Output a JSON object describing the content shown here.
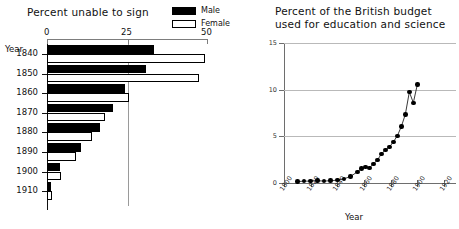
{
  "left": {
    "title": "Percent unable to sign",
    "y_axis_label": "Year",
    "legend": [
      {
        "name": "male-swatch",
        "label": "Male",
        "color": "#000000"
      },
      {
        "name": "female-swatch",
        "label": "Female",
        "color": "#ffffff"
      }
    ],
    "x_ticks": [
      "0",
      "25",
      "50"
    ]
  },
  "right": {
    "title_line1": "Percent of the British budget",
    "title_line2": "used for education and science",
    "x_axis_label": "Year",
    "y_ticks": [
      "0",
      "5",
      "10",
      "15"
    ],
    "x_ticks": [
      "1800",
      "1820",
      "1840",
      "1860",
      "1880",
      "1900",
      "1920"
    ]
  },
  "chart_data": [
    {
      "type": "bar",
      "title": "Percent unable to sign",
      "orientation": "horizontal",
      "xlabel": "",
      "ylabel": "Year",
      "xlim": [
        0,
        50
      ],
      "grid": true,
      "gridlines_x": [
        25
      ],
      "categories": [
        "1840",
        "1850",
        "1860",
        "1870",
        "1880",
        "1890",
        "1900",
        "1910"
      ],
      "series": [
        {
          "name": "Male",
          "color": "#000000",
          "values": [
            33.5,
            31.0,
            24.5,
            20.5,
            16.5,
            10.5,
            4.0,
            1.2
          ]
        },
        {
          "name": "Female",
          "color": "#ffffff",
          "values": [
            49.5,
            47.5,
            25.5,
            18.0,
            14.0,
            9.0,
            4.5,
            1.5
          ]
        }
      ]
    },
    {
      "type": "line",
      "title": "Percent of the British budget used for education and science",
      "xlabel": "Year",
      "ylabel": "",
      "xlim": [
        1800,
        1920
      ],
      "ylim": [
        0,
        15
      ],
      "grid": true,
      "gridlines_y": [
        5,
        10,
        15
      ],
      "markers": "filled-circle",
      "x": [
        1810,
        1815,
        1820,
        1825,
        1830,
        1835,
        1840,
        1845,
        1850,
        1855,
        1858,
        1861,
        1864,
        1867,
        1870,
        1873,
        1876,
        1879,
        1882,
        1885,
        1888,
        1891,
        1894,
        1897,
        1900
      ],
      "y": [
        0.15,
        0.2,
        0.2,
        0.25,
        0.2,
        0.25,
        0.3,
        0.45,
        0.7,
        1.2,
        1.55,
        1.7,
        1.6,
        2.05,
        2.45,
        3.1,
        3.55,
        3.85,
        4.4,
        5.05,
        6.05,
        7.35,
        9.75,
        8.6,
        10.55,
        11.4
      ]
    }
  ]
}
